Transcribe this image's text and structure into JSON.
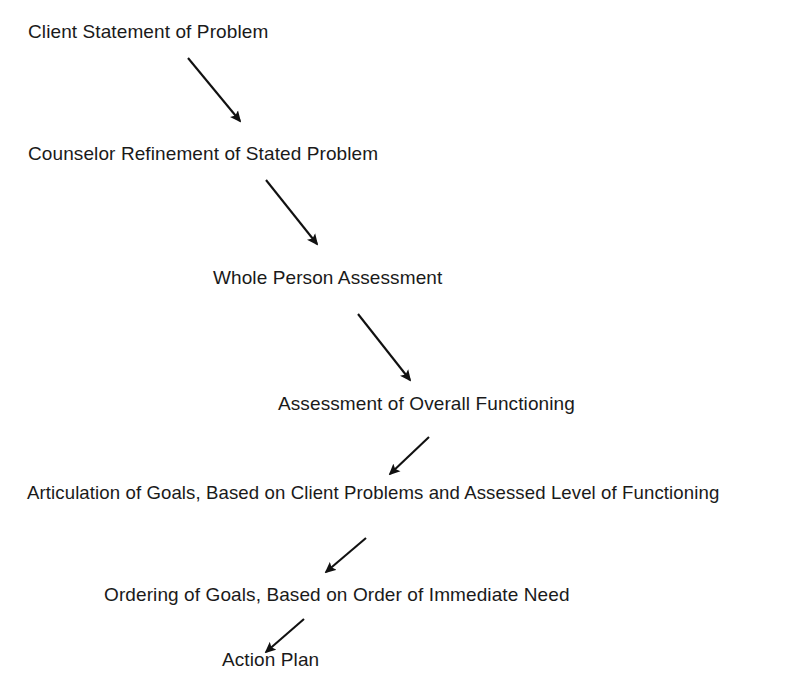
{
  "diagram": {
    "background_color": "#ffffff",
    "ink_color": "#1a1a1a",
    "nodes": [
      {
        "id": "client-statement",
        "label": "Client Statement of Problem"
      },
      {
        "id": "counselor-refinement",
        "label": "Counselor Refinement of Stated Problem"
      },
      {
        "id": "whole-person-assessment",
        "label": "Whole Person Assessment"
      },
      {
        "id": "overall-functioning",
        "label": "Assessment of Overall Functioning"
      },
      {
        "id": "articulation-of-goals",
        "label": "Articulation of Goals, Based on Client Problems and Assessed Level of Functioning"
      },
      {
        "id": "ordering-of-goals",
        "label": "Ordering of Goals, Based on Order of Immediate Need"
      },
      {
        "id": "action-plan",
        "label": "Action Plan"
      }
    ],
    "connectors": [
      {
        "id": "arrow-1",
        "from": "client-statement",
        "to": "counselor-refinement",
        "direction": "down-right",
        "x1": 188,
        "y1": 58,
        "x2": 240,
        "y2": 121
      },
      {
        "id": "arrow-2",
        "from": "counselor-refinement",
        "to": "whole-person-assessment",
        "direction": "down-right",
        "x1": 266,
        "y1": 180,
        "x2": 317,
        "y2": 244
      },
      {
        "id": "arrow-3",
        "from": "whole-person-assessment",
        "to": "overall-functioning",
        "direction": "down-right",
        "x1": 358,
        "y1": 314,
        "x2": 410,
        "y2": 380
      },
      {
        "id": "arrow-4",
        "from": "overall-functioning",
        "to": "articulation-of-goals",
        "direction": "down-left",
        "x1": 429,
        "y1": 437,
        "x2": 390,
        "y2": 474
      },
      {
        "id": "arrow-5",
        "from": "articulation-of-goals",
        "to": "ordering-of-goals",
        "direction": "down-left",
        "x1": 366,
        "y1": 538,
        "x2": 326,
        "y2": 572
      },
      {
        "id": "arrow-6",
        "from": "ordering-of-goals",
        "to": "action-plan",
        "direction": "down-left",
        "x1": 304,
        "y1": 619,
        "x2": 266,
        "y2": 652
      }
    ]
  }
}
